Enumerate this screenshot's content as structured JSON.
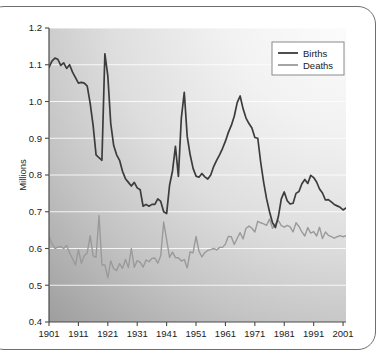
{
  "chart_data": {
    "type": "line",
    "title": "",
    "xlabel": "",
    "ylabel": "Millions",
    "xlim": [
      1901,
      2002
    ],
    "ylim": [
      0.4,
      1.2
    ],
    "grid": true,
    "legend_position": "top-right",
    "x_tick_labels": [
      "1901",
      "1911",
      "1921",
      "1931",
      "1941",
      "1951",
      "1961",
      "1971",
      "1981",
      "1991",
      "2001"
    ],
    "x_ticks": [
      1901,
      1911,
      1921,
      1931,
      1941,
      1951,
      1961,
      1971,
      1981,
      1991,
      2001
    ],
    "y_tick_labels": [
      "0.4",
      "0.5",
      "0.6",
      "0.7",
      "0.8",
      "0.9",
      "1.0",
      "1.1",
      "1.2"
    ],
    "y_ticks": [
      0.4,
      0.5,
      0.6,
      0.7,
      0.8,
      0.9,
      1.0,
      1.1,
      1.2
    ],
    "x": [
      1901,
      1902,
      1903,
      1904,
      1905,
      1906,
      1907,
      1908,
      1909,
      1910,
      1911,
      1912,
      1913,
      1914,
      1915,
      1916,
      1917,
      1918,
      1919,
      1920,
      1921,
      1922,
      1923,
      1924,
      1925,
      1926,
      1927,
      1928,
      1929,
      1930,
      1931,
      1932,
      1933,
      1934,
      1935,
      1936,
      1937,
      1938,
      1939,
      1940,
      1941,
      1942,
      1943,
      1944,
      1945,
      1946,
      1947,
      1948,
      1949,
      1950,
      1951,
      1952,
      1953,
      1954,
      1955,
      1956,
      1957,
      1958,
      1959,
      1960,
      1961,
      1962,
      1963,
      1964,
      1965,
      1966,
      1967,
      1968,
      1969,
      1970,
      1971,
      1972,
      1973,
      1974,
      1975,
      1976,
      1977,
      1978,
      1979,
      1980,
      1981,
      1982,
      1983,
      1984,
      1985,
      1986,
      1987,
      1988,
      1989,
      1990,
      1991,
      1992,
      1993,
      1994,
      1995,
      1996,
      1997,
      1998,
      1999,
      2000,
      2001,
      2002
    ],
    "series": [
      {
        "name": "Births",
        "color": "#3c3c3c",
        "values": [
          1.093,
          1.11,
          1.118,
          1.115,
          1.098,
          1.105,
          1.09,
          1.1,
          1.08,
          1.065,
          1.05,
          1.052,
          1.05,
          1.042,
          0.995,
          0.935,
          0.855,
          0.847,
          0.84,
          1.13,
          1.07,
          0.94,
          0.88,
          0.855,
          0.84,
          0.81,
          0.79,
          0.78,
          0.77,
          0.78,
          0.765,
          0.76,
          0.715,
          0.72,
          0.715,
          0.72,
          0.72,
          0.735,
          0.728,
          0.7,
          0.695,
          0.772,
          0.811,
          0.878,
          0.796,
          0.955,
          1.025,
          0.905,
          0.855,
          0.818,
          0.797,
          0.794,
          0.804,
          0.795,
          0.789,
          0.8,
          0.823,
          0.84,
          0.855,
          0.872,
          0.892,
          0.916,
          0.935,
          0.96,
          0.997,
          1.015,
          0.98,
          0.955,
          0.94,
          0.928,
          0.902,
          0.9,
          0.834,
          0.78,
          0.735,
          0.7,
          0.67,
          0.657,
          0.687,
          0.735,
          0.754,
          0.73,
          0.721,
          0.723,
          0.75,
          0.755,
          0.776,
          0.788,
          0.777,
          0.799,
          0.793,
          0.781,
          0.762,
          0.751,
          0.732,
          0.733,
          0.727,
          0.72,
          0.716,
          0.712,
          0.705,
          0.71
        ]
      },
      {
        "name": "Deaths",
        "color": "#9a9a9a",
        "values": [
          0.632,
          0.613,
          0.6,
          0.604,
          0.605,
          0.6,
          0.608,
          0.588,
          0.572,
          0.555,
          0.597,
          0.56,
          0.58,
          0.588,
          0.635,
          0.58,
          0.576,
          0.69,
          0.555,
          0.555,
          0.52,
          0.566,
          0.545,
          0.54,
          0.559,
          0.546,
          0.57,
          0.548,
          0.6,
          0.549,
          0.567,
          0.562,
          0.549,
          0.569,
          0.564,
          0.573,
          0.574,
          0.56,
          0.58,
          0.672,
          0.624,
          0.576,
          0.59,
          0.575,
          0.575,
          0.566,
          0.57,
          0.547,
          0.591,
          0.588,
          0.633,
          0.593,
          0.577,
          0.589,
          0.595,
          0.597,
          0.6,
          0.596,
          0.603,
          0.603,
          0.612,
          0.633,
          0.632,
          0.611,
          0.628,
          0.643,
          0.626,
          0.655,
          0.661,
          0.655,
          0.645,
          0.674,
          0.67,
          0.667,
          0.663,
          0.68,
          0.655,
          0.667,
          0.676,
          0.662,
          0.658,
          0.663,
          0.659,
          0.645,
          0.67,
          0.66,
          0.645,
          0.634,
          0.657,
          0.642,
          0.646,
          0.634,
          0.658,
          0.627,
          0.645,
          0.636,
          0.632,
          0.628,
          0.632,
          0.635,
          0.632,
          0.635
        ]
      }
    ],
    "legend": [
      {
        "label": "Births",
        "color": "#3c3c3c"
      },
      {
        "label": "Deaths",
        "color": "#9a9a9a"
      }
    ]
  },
  "plot": {
    "background_gradient_from": "#9e9e9e",
    "background_gradient_to": "#ffffff"
  }
}
